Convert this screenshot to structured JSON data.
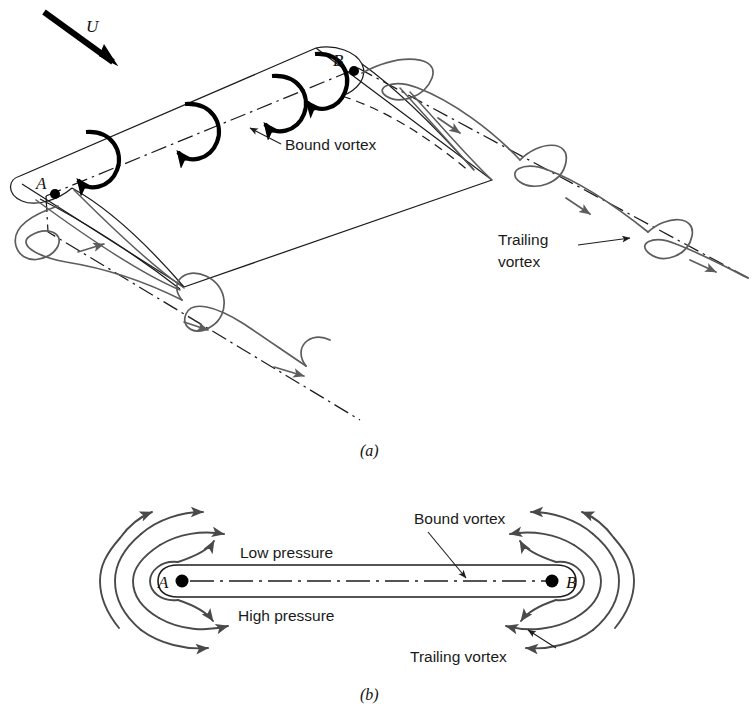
{
  "figure": {
    "panels": [
      {
        "id": "a",
        "caption": "(a)"
      },
      {
        "id": "b",
        "caption": "(b)"
      }
    ]
  },
  "panel_a": {
    "caption": "(a)",
    "freestream_label": "U",
    "point_a_label": "A",
    "point_b_label": "B",
    "bound_vortex_label": "Bound vortex",
    "trailing_vortex_label_line1": "Trailing",
    "trailing_vortex_label_line2": "vortex"
  },
  "panel_b": {
    "caption": "(b)",
    "point_a_label": "A",
    "point_b_label": "B",
    "low_pressure_label": "Low pressure",
    "high_pressure_label": "High pressure",
    "bound_vortex_label": "Bound vortex",
    "trailing_vortex_label": "Trailing vortex"
  },
  "colors": {
    "ink": "#1c1c1c",
    "vortex_gray": "#5d5d5d",
    "bound_black": "#000000",
    "background": "#ffffff"
  }
}
